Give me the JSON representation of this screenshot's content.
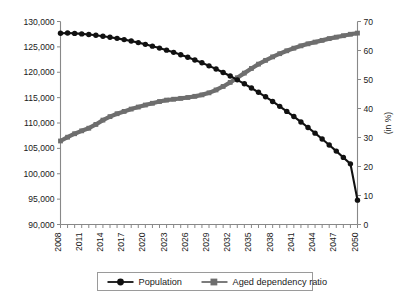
{
  "chart_data": {
    "type": "line",
    "title": "",
    "xlabel": "",
    "ylabel": "",
    "ylabel_right": "(in %)",
    "grid": false,
    "legend_position": "bottom",
    "x": [
      2008,
      2009,
      2010,
      2011,
      2012,
      2013,
      2014,
      2015,
      2016,
      2017,
      2018,
      2019,
      2020,
      2021,
      2022,
      2023,
      2024,
      2025,
      2026,
      2027,
      2028,
      2029,
      2030,
      2031,
      2032,
      2033,
      2034,
      2035,
      2036,
      2037,
      2038,
      2039,
      2040,
      2041,
      2042,
      2043,
      2044,
      2045,
      2046,
      2047,
      2048,
      2049,
      2050
    ],
    "x_tick_labels": [
      "2008",
      "2011",
      "2014",
      "2017",
      "2020",
      "2023",
      "2026",
      "2029",
      "2032",
      "2035",
      "2038",
      "2041",
      "2044",
      "2047",
      "2050"
    ],
    "x_tick_values": [
      2008,
      2011,
      2014,
      2017,
      2020,
      2023,
      2026,
      2029,
      2032,
      2035,
      2038,
      2041,
      2044,
      2047,
      2050
    ],
    "xlim": [
      2008,
      2050
    ],
    "left_axis": {
      "label": "",
      "ylim": [
        90000,
        130000
      ],
      "ticks": [
        90000,
        95000,
        100000,
        105000,
        110000,
        115000,
        120000,
        125000,
        130000
      ],
      "tick_labels": [
        "90,000",
        "95,000",
        "100,000",
        "105,000",
        "110,000",
        "115,000",
        "120,000",
        "125,000",
        "130,000"
      ]
    },
    "right_axis": {
      "label": "(in %)",
      "ylim": [
        0,
        70
      ],
      "ticks": [
        0,
        10,
        20,
        30,
        40,
        50,
        60,
        70
      ],
      "tick_labels": [
        "0",
        "10",
        "20",
        "30",
        "40",
        "50",
        "60",
        "70"
      ]
    },
    "series": [
      {
        "name": "Population",
        "axis": "left",
        "color": "#111111",
        "marker": "circle",
        "values": [
          127690,
          127730,
          127660,
          127560,
          127430,
          127280,
          127100,
          126900,
          126680,
          126430,
          126150,
          125840,
          125500,
          125140,
          124760,
          124350,
          123920,
          123450,
          122950,
          122420,
          121860,
          121260,
          120630,
          119960,
          119250,
          118500,
          117720,
          116900,
          116050,
          115160,
          114240,
          113280,
          112290,
          111270,
          110210,
          109120,
          108000,
          106850,
          105670,
          104460,
          103220,
          101950,
          94800
        ]
      },
      {
        "name": "Aged dependency ratio",
        "axis": "right",
        "color": "#6e6e6e",
        "marker": "square",
        "values": [
          28.8,
          30.1,
          31.3,
          32.3,
          33.2,
          34.5,
          36.0,
          37.2,
          38.2,
          39.0,
          39.8,
          40.5,
          41.2,
          41.8,
          42.4,
          42.9,
          43.2,
          43.5,
          43.8,
          44.2,
          44.7,
          45.4,
          46.4,
          47.6,
          49.0,
          50.6,
          52.2,
          53.8,
          55.3,
          56.6,
          57.8,
          58.9,
          59.9,
          60.8,
          61.6,
          62.3,
          62.9,
          63.5,
          64.1,
          64.6,
          65.1,
          65.6,
          66.0
        ]
      }
    ]
  },
  "legend": {
    "items": [
      {
        "label": "Population",
        "marker": "circle",
        "color": "#111111"
      },
      {
        "label": "Aged dependency ratio",
        "marker": "square",
        "color": "#6e6e6e"
      }
    ]
  }
}
